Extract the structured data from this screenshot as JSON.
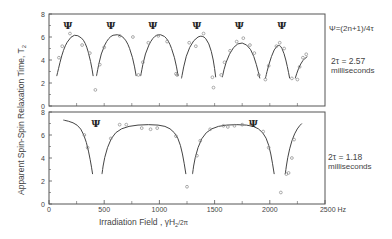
{
  "chart_data": [
    {
      "type": "line",
      "panel": "upper",
      "title": "",
      "xlabel": "Irradiation Field, γH2/2π",
      "ylabel": "Apparent Spin-Spin Relaxation Time, T2",
      "xlim": [
        0,
        2500
      ],
      "ylim": [
        0,
        8
      ],
      "yticks": [
        "0",
        "2",
        "4",
        "6",
        "8"
      ],
      "annotation": "2τ = 2.57 milliseconds",
      "psi_legend": "Ψ = (2n+1)/4τ",
      "psi_positions_hz": [
        170,
        560,
        940,
        1340,
        1725,
        2110
      ],
      "fit_arches": [
        {
          "x": [
            70,
            130,
            200,
            260,
            330,
            380,
            400
          ],
          "y": [
            2.6,
            5.0,
            6.1,
            6.2,
            5.6,
            3.8,
            2.6
          ]
        },
        {
          "x": [
            430,
            470,
            540,
            620,
            700,
            760,
            790
          ],
          "y": [
            2.6,
            4.6,
            6.0,
            6.3,
            5.8,
            4.2,
            2.6
          ]
        },
        {
          "x": [
            830,
            870,
            940,
            1010,
            1080,
            1140,
            1170
          ],
          "y": [
            2.6,
            4.6,
            6.0,
            6.3,
            5.8,
            4.2,
            2.6
          ]
        },
        {
          "x": [
            1200,
            1240,
            1310,
            1390,
            1450,
            1490,
            1510
          ],
          "y": [
            2.4,
            4.4,
            5.8,
            6.2,
            5.5,
            4.0,
            2.5
          ]
        },
        {
          "x": [
            1570,
            1600,
            1670,
            1750,
            1830,
            1880,
            1910
          ],
          "y": [
            2.5,
            3.8,
            5.2,
            5.6,
            5.0,
            3.6,
            2.4
          ]
        },
        {
          "x": [
            1960,
            1990,
            2040,
            2090,
            2130,
            2160,
            2180
          ],
          "y": [
            2.4,
            3.6,
            5.0,
            5.4,
            4.6,
            3.4,
            2.4
          ]
        },
        {
          "x": [
            2230,
            2260,
            2300,
            2340
          ],
          "y": [
            2.4,
            3.3,
            4.0,
            4.3
          ]
        }
      ],
      "points": {
        "x": [
          90,
          120,
          190,
          300,
          370,
          420,
          460,
          500,
          640,
          760,
          810,
          850,
          900,
          990,
          1070,
          1150,
          1160,
          1270,
          1330,
          1400,
          1480,
          1490,
          1560,
          1590,
          1640,
          1700,
          1760,
          1820,
          1860,
          1900,
          1960,
          1990,
          2060,
          2090,
          2130,
          2200,
          2250,
          2270,
          2300,
          2330
        ],
        "y": [
          4.2,
          5.2,
          6.3,
          5.3,
          4.6,
          1.4,
          3.6,
          5.1,
          6.1,
          6.0,
          2.7,
          3.8,
          5.5,
          6.1,
          5.6,
          2.8,
          2.7,
          5.5,
          5.2,
          6.3,
          2.5,
          1.6,
          2.7,
          3.8,
          4.8,
          5.6,
          5.9,
          5.3,
          4.6,
          2.7,
          2.3,
          3.5,
          5.2,
          5.5,
          5.0,
          2.4,
          2.3,
          3.4,
          4.2,
          4.5
        ]
      }
    },
    {
      "type": "line",
      "panel": "lower",
      "title": "",
      "xlabel": "Irradiation Field, γH2/2π",
      "ylabel": "Apparent Spin-Spin Relaxation Time, T2",
      "xlim": [
        0,
        2500
      ],
      "ylim": [
        0,
        8
      ],
      "xticks": [
        "0",
        "500",
        "1000",
        "1500",
        "2000",
        "2500 Hz"
      ],
      "yticks": [
        "0",
        "2",
        "4",
        "6",
        "8"
      ],
      "annotation": "2τ = 1.18 milliseconds",
      "psi_positions_hz": [
        425,
        1850
      ],
      "fit_arches": [
        {
          "x": [
            130,
            220,
            290,
            340,
            375,
            395
          ],
          "y": [
            7.3,
            7.1,
            6.6,
            5.4,
            3.8,
            2.6
          ]
        },
        {
          "x": [
            480,
            500,
            560,
            650,
            800,
            1000,
            1100,
            1170,
            1210,
            1240
          ],
          "y": [
            2.6,
            4.0,
            5.8,
            6.6,
            6.9,
            6.9,
            6.6,
            5.8,
            4.4,
            2.6
          ]
        },
        {
          "x": [
            1300,
            1320,
            1380,
            1470,
            1600,
            1800,
            1900,
            1970,
            2010,
            2040
          ],
          "y": [
            2.6,
            4.0,
            5.8,
            6.6,
            6.9,
            6.9,
            6.6,
            5.8,
            4.4,
            2.6
          ]
        },
        {
          "x": [
            2140,
            2160,
            2200,
            2250,
            2290
          ],
          "y": [
            2.6,
            4.0,
            5.6,
            6.6,
            7.0
          ]
        }
      ],
      "points": {
        "x": [
          320,
          350,
          560,
          640,
          700,
          840,
          920,
          980,
          1150,
          1250,
          1340,
          1370,
          1460,
          1580,
          1620,
          1680,
          1750,
          1830,
          1940,
          1990,
          2100,
          2150,
          2170,
          2200,
          2220
        ],
        "y": [
          6.0,
          4.9,
          5.7,
          6.9,
          6.9,
          6.6,
          6.5,
          6.6,
          5.9,
          1.5,
          4.2,
          5.5,
          6.5,
          6.8,
          6.7,
          6.8,
          6.9,
          6.9,
          6.3,
          4.9,
          1.0,
          2.6,
          2.7,
          4.0,
          5.6
        ]
      }
    }
  ],
  "labels": {
    "ylabel": "Apparent  Spin-Spin  Relaxation  Time,  T",
    "ylabel_sub": "2",
    "xlabel": "Irradiation  Field ,  γH",
    "xlabel_sub": "2",
    "xlabel_tail": "/2π",
    "psi_legend": "Ψ=(2n+1)/4τ",
    "upper_tau_line1": "2τ = 2.57",
    "upper_tau_line2": "milliseconds",
    "lower_tau_line1": "2τ = 1.18",
    "lower_tau_line2": "milliseconds",
    "psi_glyph": "Ψ",
    "xticks": [
      "0",
      "500",
      "1000",
      "1500",
      "2000",
      "2500 Hz"
    ],
    "yticks": [
      "0",
      "2",
      "4",
      "6",
      "8"
    ]
  },
  "colors": {
    "line": "#444444",
    "frame": "#555555",
    "point": "#888888",
    "text": "#444444"
  }
}
